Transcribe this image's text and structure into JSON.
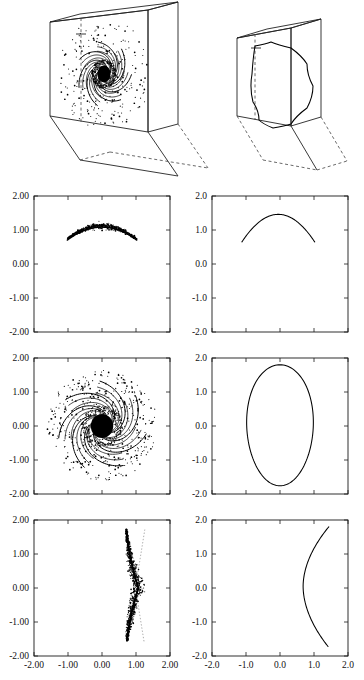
{
  "figure": {
    "title": "",
    "columns": 2,
    "rows": 4
  },
  "chart_data": [
    {
      "id": "box-left",
      "type": "scatter",
      "title": "",
      "description": "3D slab box containing a spiral (pinwheel) orbit cloud on its front face",
      "xlabel": "",
      "ylabel": "",
      "grid": false,
      "legend": null,
      "spiral": {
        "arms": 7,
        "core_radius": 0.3,
        "turns": 0.85,
        "scatter_points": 240
      }
    },
    {
      "id": "box-right",
      "type": "line",
      "title": "",
      "description": "3D slab box containing a single closed teardrop invariant curve on its front face",
      "xlabel": "",
      "ylabel": "",
      "grid": false,
      "legend": null
    },
    {
      "id": "plot-r1c1",
      "type": "scatter",
      "title": "",
      "xlabel": "",
      "ylabel": "",
      "xlim": [
        -2.0,
        2.0
      ],
      "ylim": [
        -2.0,
        2.0
      ],
      "xticks": [
        -2.0,
        -1.0,
        0.0,
        1.0,
        2.0
      ],
      "yticks": [
        -2.0,
        -1.0,
        0.0,
        1.0,
        2.0
      ],
      "xticklabels": [
        "",
        "",
        "",
        "",
        ""
      ],
      "yticklabels": [
        "-2.00",
        "-1.00",
        "0.00",
        "1.00",
        "2.00"
      ],
      "grid": false,
      "legend": null,
      "description": "Scattered arc of points forming a downward-opening cap near y=1.0",
      "arc": {
        "center_x": 0.0,
        "peak_y": 1.12,
        "half_width": 1.02,
        "depth": 0.38,
        "spread": 0.12,
        "points": 520
      }
    },
    {
      "id": "plot-r1c2",
      "type": "line",
      "title": "",
      "xlabel": "",
      "ylabel": "",
      "xlim": [
        -2.0,
        2.0
      ],
      "ylim": [
        -2.0,
        2.0
      ],
      "xticks": [
        -2.0,
        -1.0,
        0.0,
        1.0,
        2.0
      ],
      "yticks": [
        -2.0,
        -1.0,
        0.0,
        1.0,
        2.0
      ],
      "xticklabels": [
        "",
        "",
        "",
        "",
        ""
      ],
      "yticklabels": [
        "-2.0",
        "-1.0",
        "0.0",
        "1.0",
        "2.0"
      ],
      "grid": false,
      "legend": null,
      "description": "Smooth downward-opening arc peaking near (0, 1.45)",
      "arc": {
        "center_x": -0.05,
        "peak_y": 1.46,
        "left_x": -1.12,
        "left_y": 0.65,
        "right_x": 1.02,
        "right_y": 0.72
      }
    },
    {
      "id": "plot-r2c1",
      "type": "scatter",
      "title": "",
      "xlabel": "",
      "ylabel": "",
      "xlim": [
        -2.0,
        2.0
      ],
      "ylim": [
        -2.0,
        2.0
      ],
      "xticks": [
        -2.0,
        -1.0,
        0.0,
        1.0,
        2.0
      ],
      "yticks": [
        -2.0,
        -1.0,
        0.0,
        1.0,
        2.0
      ],
      "xticklabels": [
        "",
        "",
        "",
        "",
        ""
      ],
      "yticklabels": [
        "-2.00",
        "-1.00",
        "0.00",
        "1.00",
        "2.00"
      ],
      "grid": false,
      "legend": null,
      "description": "Chaotic spiral pinwheel centered at origin with dense black core and ~7 curved arms, surrounded by scattered points",
      "spiral": {
        "arms": 7,
        "core_radius": 0.33,
        "arm_length": 1.05,
        "turns": 0.8,
        "scatter_points": 420,
        "scatter_radius": 1.6
      }
    },
    {
      "id": "plot-r2c2",
      "type": "line",
      "title": "",
      "xlabel": "",
      "ylabel": "",
      "xlim": [
        -2.0,
        2.0
      ],
      "ylim": [
        -2.0,
        2.0
      ],
      "xticks": [
        -2.0,
        -1.0,
        0.0,
        1.0,
        2.0
      ],
      "yticks": [
        -2.0,
        -1.0,
        0.0,
        1.0,
        2.0
      ],
      "xticklabels": [
        "",
        "",
        "",
        "",
        ""
      ],
      "yticklabels": [
        "-2.0",
        "-1.0",
        "0.0",
        "1.0",
        "2.0"
      ],
      "grid": false,
      "legend": null,
      "description": "Closed oval (egg-shaped) invariant curve centered near origin",
      "oval": {
        "cx": 0.0,
        "cy": 0.02,
        "rx": 0.98,
        "ry": 1.78
      }
    },
    {
      "id": "plot-r3c1",
      "type": "scatter",
      "title": "",
      "xlabel": "",
      "ylabel": "",
      "xlim": [
        -2.0,
        2.0
      ],
      "ylim": [
        -2.0,
        2.0
      ],
      "xticks": [
        -2.0,
        -1.0,
        0.0,
        1.0,
        2.0
      ],
      "yticks": [
        -2.0,
        -1.0,
        0.0,
        1.0,
        2.0
      ],
      "xticklabels": [
        "-2.00",
        "-1.00",
        "0.00",
        "1.00",
        "2.00"
      ],
      "yticklabels": [
        "-2.00",
        "-1.00",
        "0.00",
        "1.00",
        "2.00"
      ],
      "grid": false,
      "legend": null,
      "description": "Dense vertical sliver of points bowing rightward near x=1.0, with thin tails reaching to y=1.7 and y=-1.5",
      "blade": {
        "x_center": 0.95,
        "bulge": 0.22,
        "top_y": 1.72,
        "bottom_y": -1.55,
        "points": 900
      }
    },
    {
      "id": "plot-r3c2",
      "type": "line",
      "title": "",
      "xlabel": "",
      "ylabel": "",
      "xlim": [
        -2.0,
        2.0
      ],
      "ylim": [
        -2.0,
        2.0
      ],
      "xticks": [
        -2.0,
        -1.0,
        0.0,
        1.0,
        2.0
      ],
      "yticks": [
        -2.0,
        -1.0,
        0.0,
        1.0,
        2.0
      ],
      "xticklabels": [
        "-2.0",
        "-1.0",
        "0.0",
        "1.0",
        "2.0"
      ],
      "yticklabels": [
        "-2.0",
        "-1.0",
        "0.0",
        "1.0",
        "2.0"
      ],
      "grid": false,
      "legend": null,
      "description": "Smooth C-shaped (leftward-opening) curve with vertex near (0.68, 0.05), endpoints at (1.45, 1.80) and (1.42, -1.72)",
      "curve": {
        "vertex_x": 0.68,
        "vertex_y": 0.05,
        "top_x": 1.46,
        "top_y": 1.8,
        "bottom_x": 1.42,
        "bottom_y": -1.72
      }
    }
  ]
}
